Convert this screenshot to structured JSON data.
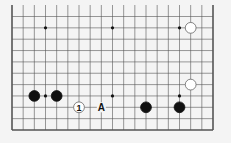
{
  "diagram": {
    "type": "go-board-fragment",
    "grid": {
      "cols": 19,
      "rows": 11,
      "left_edge": true,
      "right_edge": true,
      "bottom_edge": true,
      "top_edge": false
    },
    "star_points": [
      [
        3,
        1
      ],
      [
        9,
        1
      ],
      [
        15,
        1
      ],
      [
        3,
        7
      ],
      [
        9,
        7
      ],
      [
        15,
        7
      ]
    ],
    "stones": [
      {
        "color": "white",
        "col": 16,
        "row": 1
      },
      {
        "color": "white",
        "col": 16,
        "row": 6
      },
      {
        "color": "black",
        "col": 2,
        "row": 7
      },
      {
        "color": "black",
        "col": 4,
        "row": 7
      },
      {
        "color": "black",
        "col": 12,
        "row": 8
      },
      {
        "color": "black",
        "col": 15,
        "row": 8
      },
      {
        "color": "white",
        "col": 6,
        "row": 8,
        "label": "1"
      }
    ],
    "labels": [
      {
        "text": "A",
        "col": 8,
        "row": 8
      }
    ],
    "colors": {
      "background": "#f4f4f4",
      "line": "#555555",
      "black": "#111111",
      "white": "#ffffff"
    }
  }
}
